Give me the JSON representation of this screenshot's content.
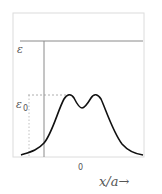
{
  "diagram": {
    "labels": {
      "epsilon": "ε",
      "epsilon0_main": "ε",
      "epsilon0_sub": "0",
      "origin": "0",
      "xaxis": "x/a→"
    },
    "colors": {
      "frame": "#d8d8d8",
      "line": "#8a8a8a",
      "curve": "#111111",
      "dashed": "#9a9a9a",
      "text": "#555555"
    }
  }
}
